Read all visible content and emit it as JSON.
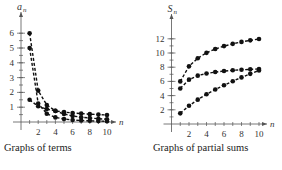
{
  "chart_data": [
    {
      "type": "scatter",
      "title": "Graphs of terms",
      "xlabel": "n",
      "ylabel": "a_n",
      "xticks": [
        2,
        4,
        6,
        8,
        10
      ],
      "yticks": [
        1,
        2,
        3,
        4,
        5,
        6
      ],
      "xlim": [
        0,
        10.5
      ],
      "ylim": [
        0,
        6.5
      ],
      "x": [
        1,
        2,
        3,
        4,
        5,
        6,
        7,
        8,
        9,
        10
      ],
      "series": [
        {
          "name": "6/n^1.5",
          "values": [
            6,
            2.12,
            1.15,
            0.75,
            0.54,
            0.41,
            0.32,
            0.27,
            0.22,
            0.19
          ]
        },
        {
          "name": "5/n^2",
          "values": [
            5,
            1.25,
            0.56,
            0.31,
            0.2,
            0.14,
            0.1,
            0.08,
            0.06,
            0.05
          ]
        },
        {
          "name": "1.5/sqrt(n)",
          "values": [
            1.5,
            1.06,
            0.87,
            0.75,
            0.67,
            0.61,
            0.57,
            0.53,
            0.5,
            0.47
          ]
        }
      ]
    },
    {
      "type": "scatter",
      "title": "Graphs of partial sums",
      "xlabel": "n",
      "ylabel": "S_n",
      "xticks": [
        2,
        4,
        6,
        8,
        10
      ],
      "yticks": [
        2,
        4,
        6,
        8,
        10,
        12
      ],
      "xlim": [
        0,
        10.5
      ],
      "ylim": [
        0,
        13
      ],
      "x": [
        1,
        2,
        3,
        4,
        5,
        6,
        7,
        8,
        9,
        10
      ],
      "series": [
        {
          "name": "sum 6/n^1.5",
          "values": [
            6,
            8.12,
            9.27,
            10.02,
            10.56,
            10.97,
            11.29,
            11.56,
            11.78,
            11.97
          ]
        },
        {
          "name": "sum 5/n^2",
          "values": [
            5,
            6.25,
            6.81,
            7.12,
            7.32,
            7.46,
            7.56,
            7.64,
            7.7,
            7.75
          ]
        },
        {
          "name": "sum 1.5/sqrt(n)",
          "values": [
            1.5,
            2.56,
            3.43,
            4.18,
            4.85,
            5.46,
            6.03,
            6.56,
            7.06,
            7.54
          ]
        }
      ]
    }
  ],
  "captions": {
    "left": "Graphs of terms",
    "right": "Graphs of partial sums"
  },
  "axis": {
    "n": "n",
    "a": "a",
    "a_sub": "n",
    "s": "S",
    "s_sub": "n"
  }
}
